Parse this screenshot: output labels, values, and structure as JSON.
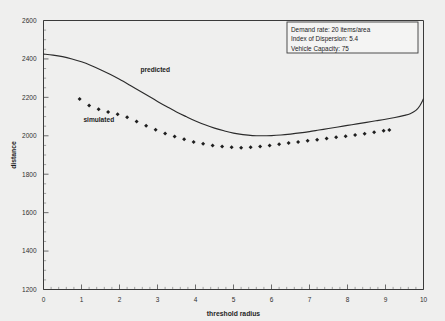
{
  "chart_data": {
    "type": "line",
    "title": "",
    "xlabel": "threshold radius",
    "ylabel": "distance",
    "xlim": [
      0,
      10
    ],
    "ylim": [
      1200,
      2600
    ],
    "grid": false,
    "legend_position": "top-right",
    "xticks": [
      0,
      1,
      2,
      3,
      4,
      5,
      6,
      7,
      8,
      9,
      10
    ],
    "yticks": [
      1200,
      1400,
      1600,
      1800,
      2000,
      2200,
      2400,
      2600
    ],
    "x_minor_interval": 0.2,
    "y_minor_interval": 50,
    "annotations": [
      {
        "text": "predicted",
        "x": 2.55,
        "y": 2330
      },
      {
        "text": "simulated",
        "x": 1.05,
        "y": 2070
      }
    ],
    "series": [
      {
        "name": "predicted",
        "style": "solid-line",
        "color": "#2b2b2b",
        "x": [
          0.0,
          0.25,
          0.5,
          0.75,
          1.0,
          1.25,
          1.5,
          1.75,
          2.0,
          2.25,
          2.5,
          2.75,
          3.0,
          3.25,
          3.5,
          3.75,
          4.0,
          4.25,
          4.5,
          4.75,
          5.0,
          5.25,
          5.5,
          5.75,
          6.0,
          6.25,
          6.5,
          6.75,
          7.0,
          7.25,
          7.5,
          7.75,
          8.0,
          8.25,
          8.5,
          8.75,
          9.0,
          9.25,
          9.5,
          9.65,
          9.8,
          9.9,
          10.0
        ],
        "values": [
          2425,
          2420,
          2412,
          2400,
          2385,
          2366,
          2344,
          2320,
          2294,
          2266,
          2237,
          2208,
          2179,
          2151,
          2124,
          2100,
          2077,
          2057,
          2040,
          2026,
          2014,
          2006,
          2001,
          2000,
          2001,
          2004,
          2009,
          2015,
          2022,
          2030,
          2038,
          2046,
          2054,
          2062,
          2070,
          2078,
          2086,
          2095,
          2106,
          2115,
          2132,
          2155,
          2192
        ]
      },
      {
        "name": "simulated",
        "style": "diamond-markers",
        "color": "#1e1e1e",
        "x": [
          0.95,
          1.2,
          1.45,
          1.7,
          1.95,
          2.2,
          2.45,
          2.7,
          2.95,
          3.2,
          3.45,
          3.7,
          3.95,
          4.2,
          4.45,
          4.7,
          4.95,
          5.2,
          5.45,
          5.7,
          5.95,
          6.2,
          6.45,
          6.7,
          6.95,
          7.2,
          7.45,
          7.7,
          7.95,
          8.2,
          8.45,
          8.7,
          8.95,
          9.1
        ],
        "values": [
          2192,
          2158,
          2138,
          2124,
          2112,
          2096,
          2074,
          2052,
          2032,
          2012,
          1996,
          1982,
          1968,
          1958,
          1950,
          1944,
          1940,
          1938,
          1940,
          1944,
          1950,
          1956,
          1962,
          1968,
          1974,
          1980,
          1986,
          1992,
          1998,
          2004,
          2010,
          2018,
          2026,
          2030
        ]
      }
    ]
  },
  "legend": {
    "lines": [
      "Demand rate:  20 items/area",
      "Index of Dispersion: 5.4",
      "Vehicle Capacity: 75"
    ]
  }
}
